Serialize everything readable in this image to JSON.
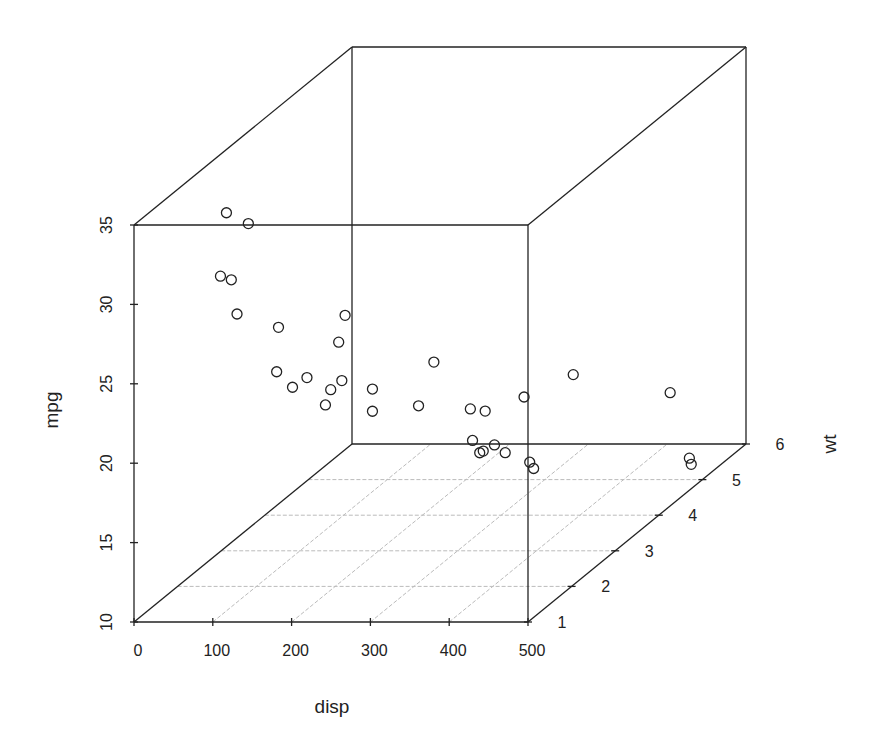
{
  "chart_data": {
    "type": "scatter3d",
    "title": "",
    "xlabel": "disp",
    "ylabel": "mpg",
    "zlabel": "wt",
    "xlim": [
      0,
      500
    ],
    "ylim": [
      10,
      35
    ],
    "zlim": [
      1,
      6
    ],
    "x_ticks": [
      0,
      100,
      200,
      300,
      400,
      500
    ],
    "y_ticks": [
      10,
      15,
      20,
      25,
      30,
      35
    ],
    "z_ticks": [
      1,
      2,
      3,
      4,
      5,
      6
    ],
    "grid": "floor",
    "marker": "open-circle",
    "points": [
      {
        "disp": 160.0,
        "wt": 2.62,
        "mpg": 21.0
      },
      {
        "disp": 160.0,
        "wt": 2.875,
        "mpg": 21.0
      },
      {
        "disp": 108.0,
        "wt": 2.32,
        "mpg": 22.8
      },
      {
        "disp": 258.0,
        "wt": 3.215,
        "mpg": 21.4
      },
      {
        "disp": 360.0,
        "wt": 3.44,
        "mpg": 18.7
      },
      {
        "disp": 225.0,
        "wt": 3.46,
        "mpg": 18.1
      },
      {
        "disp": 360.0,
        "wt": 3.57,
        "mpg": 14.3
      },
      {
        "disp": 146.7,
        "wt": 3.19,
        "mpg": 24.4
      },
      {
        "disp": 140.8,
        "wt": 3.15,
        "mpg": 22.8
      },
      {
        "disp": 167.6,
        "wt": 3.44,
        "mpg": 19.2
      },
      {
        "disp": 167.6,
        "wt": 3.44,
        "mpg": 17.8
      },
      {
        "disp": 275.8,
        "wt": 4.07,
        "mpg": 16.4
      },
      {
        "disp": 275.8,
        "wt": 3.73,
        "mpg": 17.3
      },
      {
        "disp": 275.8,
        "wt": 3.78,
        "mpg": 15.2
      },
      {
        "disp": 472.0,
        "wt": 5.25,
        "mpg": 10.4
      },
      {
        "disp": 460.0,
        "wt": 5.424,
        "mpg": 10.4
      },
      {
        "disp": 440.0,
        "wt": 5.345,
        "mpg": 14.7
      },
      {
        "disp": 78.7,
        "wt": 2.2,
        "mpg": 32.4
      },
      {
        "disp": 75.7,
        "wt": 1.615,
        "mpg": 30.4
      },
      {
        "disp": 71.1,
        "wt": 1.835,
        "mpg": 33.9
      },
      {
        "disp": 120.1,
        "wt": 2.465,
        "mpg": 21.5
      },
      {
        "disp": 318.0,
        "wt": 3.52,
        "mpg": 15.5
      },
      {
        "disp": 304.0,
        "wt": 3.435,
        "mpg": 15.2
      },
      {
        "disp": 350.0,
        "wt": 3.84,
        "mpg": 13.3
      },
      {
        "disp": 400.0,
        "wt": 3.845,
        "mpg": 19.2
      },
      {
        "disp": 79.0,
        "wt": 1.935,
        "mpg": 27.3
      },
      {
        "disp": 120.3,
        "wt": 2.14,
        "mpg": 26.0
      },
      {
        "disp": 95.1,
        "wt": 1.513,
        "mpg": 30.4
      },
      {
        "disp": 351.0,
        "wt": 3.17,
        "mpg": 15.8
      },
      {
        "disp": 145.0,
        "wt": 2.77,
        "mpg": 19.7
      },
      {
        "disp": 301.0,
        "wt": 3.57,
        "mpg": 15.0
      },
      {
        "disp": 121.0,
        "wt": 2.78,
        "mpg": 21.4
      }
    ]
  },
  "labels": {
    "x_title": "disp",
    "y_title": "mpg",
    "z_title": "wt"
  },
  "style": {
    "line_color": "#222222",
    "grid_color": "#bbbbbb",
    "point_color": "#222222"
  }
}
